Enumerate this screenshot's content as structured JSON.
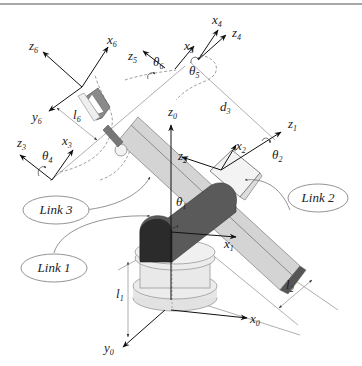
{
  "diagram": {
    "type": "robot-manipulator-kinematics",
    "colors": {
      "background": "#ffffff",
      "border": "#8a8a8a",
      "link_light": "#d4d4d4",
      "link_mid": "#bdbdbd",
      "joint_dark": "#555555",
      "joint_darker": "#2b2b2b",
      "base": "#e6e6e6",
      "axis": "#111111",
      "dimension": "#777777"
    },
    "links": [
      {
        "label": "Link 1"
      },
      {
        "label": "Link 2"
      },
      {
        "label": "Link 3"
      }
    ],
    "frames": {
      "x0": {
        "main": "x",
        "sub": "0"
      },
      "y0": {
        "main": "y",
        "sub": "0"
      },
      "z0": {
        "main": "z",
        "sub": "0"
      },
      "x1": {
        "main": "x",
        "sub": "1"
      },
      "z1": {
        "main": "z",
        "sub": "1"
      },
      "x2": {
        "main": "x",
        "sub": "2"
      },
      "z2": {
        "main": "z",
        "sub": "2"
      },
      "x3": {
        "main": "x",
        "sub": "3"
      },
      "z3": {
        "main": "z",
        "sub": "3"
      },
      "x4": {
        "main": "x",
        "sub": "4"
      },
      "z4": {
        "main": "z",
        "sub": "4"
      },
      "x5": {
        "main": "x",
        "sub": "5"
      },
      "z5": {
        "main": "z",
        "sub": "5"
      },
      "x6": {
        "main": "x",
        "sub": "6"
      },
      "y6": {
        "main": "y",
        "sub": "6"
      },
      "z6": {
        "main": "z",
        "sub": "6"
      }
    },
    "joint_angles": {
      "theta1": {
        "main": "θ",
        "sub": "1"
      },
      "theta2": {
        "main": "θ",
        "sub": "2"
      },
      "theta4": {
        "main": "θ",
        "sub": "4"
      },
      "theta5": {
        "main": "θ",
        "sub": "5"
      },
      "theta6": {
        "main": "θ",
        "sub": "6"
      }
    },
    "dimensions": {
      "l1": {
        "main": "l",
        "sub": "1"
      },
      "l2": {
        "main": "l",
        "sub": "2"
      },
      "d3": {
        "main": "d",
        "sub": "3"
      },
      "l6": {
        "main": "l",
        "sub": "6"
      }
    }
  }
}
